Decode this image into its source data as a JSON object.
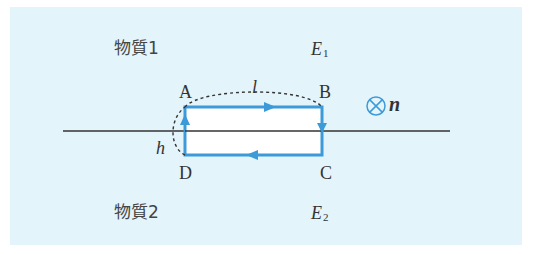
{
  "figure": {
    "background_color": "#e3f4fa",
    "loop_color": "#3d9ad9",
    "loop_fill": "#ffffff",
    "line_color": "#333333",
    "medium_top": {
      "name": "物質1",
      "field_label": "E",
      "field_subscript": "1"
    },
    "medium_bottom": {
      "name": "物質2",
      "field_label": "E",
      "field_subscript": "2"
    },
    "vertices": {
      "A": "A",
      "B": "B",
      "C": "C",
      "D": "D"
    },
    "length_label": "l",
    "height_label": "h",
    "normal": {
      "symbol": "⊗",
      "label": "n"
    },
    "loop_direction": [
      "A→B",
      "B→C",
      "C→D",
      "D→A"
    ]
  }
}
